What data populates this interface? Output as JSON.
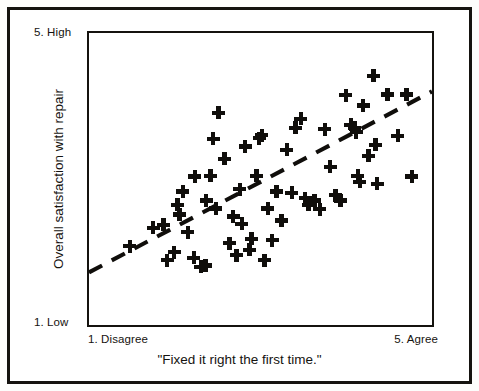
{
  "figure": {
    "background_color": "#ffffff",
    "ink_color": "#15130f",
    "border_color": "#15130f"
  },
  "labels": {
    "y_axis_title": "Overall satisfaction with repair",
    "y_high": "5. High",
    "y_low": "1. Low",
    "x_axis_title": "\"Fixed it right the first time.\"",
    "x_low": "1. Disagree",
    "x_high": "5. Agree"
  },
  "chart_data": {
    "type": "scatter",
    "title": "",
    "xlabel": "\"Fixed it right the first time.\"",
    "ylabel": "Overall satisfaction with repair",
    "xlim": [
      1,
      5
    ],
    "ylim": [
      1,
      5
    ],
    "grid": false,
    "legend": false,
    "marker": "plus",
    "marker_color": "#100e0b",
    "x_tick_labels": [
      "1. Disagree",
      "5. Agree"
    ],
    "y_tick_labels": [
      "1. Low",
      "5. High"
    ],
    "point_count": 62,
    "points": [
      [
        1.47,
        2.12
      ],
      [
        1.74,
        2.37
      ],
      [
        1.86,
        2.41
      ],
      [
        1.9,
        1.93
      ],
      [
        1.98,
        2.04
      ],
      [
        2.02,
        2.68
      ],
      [
        2.04,
        2.55
      ],
      [
        2.08,
        2.86
      ],
      [
        2.14,
        2.31
      ],
      [
        2.21,
        1.96
      ],
      [
        2.22,
        3.06
      ],
      [
        2.29,
        1.84
      ],
      [
        2.34,
        1.86
      ],
      [
        2.35,
        2.74
      ],
      [
        2.4,
        3.07
      ],
      [
        2.43,
        3.57
      ],
      [
        2.46,
        2.63
      ],
      [
        2.49,
        3.92
      ],
      [
        2.56,
        3.3
      ],
      [
        2.62,
        2.16
      ],
      [
        2.66,
        2.52
      ],
      [
        2.7,
        2.0
      ],
      [
        2.74,
        2.89
      ],
      [
        2.76,
        2.42
      ],
      [
        2.8,
        3.47
      ],
      [
        2.85,
        2.07
      ],
      [
        2.87,
        2.22
      ],
      [
        2.93,
        3.07
      ],
      [
        2.96,
        3.58
      ],
      [
        2.99,
        3.62
      ],
      [
        3.02,
        1.93
      ],
      [
        3.06,
        2.63
      ],
      [
        3.11,
        2.2
      ],
      [
        3.16,
        2.86
      ],
      [
        3.22,
        2.47
      ],
      [
        3.28,
        3.42
      ],
      [
        3.34,
        2.84
      ],
      [
        3.38,
        3.72
      ],
      [
        3.44,
        3.84
      ],
      [
        3.49,
        2.77
      ],
      [
        3.53,
        2.68
      ],
      [
        3.6,
        2.74
      ],
      [
        3.66,
        2.62
      ],
      [
        3.72,
        3.7
      ],
      [
        3.78,
        3.19
      ],
      [
        3.84,
        2.81
      ],
      [
        3.9,
        2.74
      ],
      [
        3.96,
        4.16
      ],
      [
        4.02,
        3.76
      ],
      [
        4.06,
        3.72
      ],
      [
        4.08,
        3.66
      ],
      [
        4.1,
        3.07
      ],
      [
        4.12,
        2.99
      ],
      [
        4.16,
        4.02
      ],
      [
        4.22,
        3.34
      ],
      [
        4.28,
        4.42
      ],
      [
        4.32,
        2.96
      ],
      [
        4.44,
        4.17
      ],
      [
        4.56,
        3.61
      ],
      [
        4.66,
        4.17
      ],
      [
        4.72,
        3.06
      ],
      [
        4.3,
        3.49
      ]
    ],
    "trend_line": {
      "style": "dashed",
      "color": "#100e0b",
      "x_start": 1.0,
      "y_start": 1.72,
      "x_end": 5.0,
      "y_end": 4.2
    }
  }
}
